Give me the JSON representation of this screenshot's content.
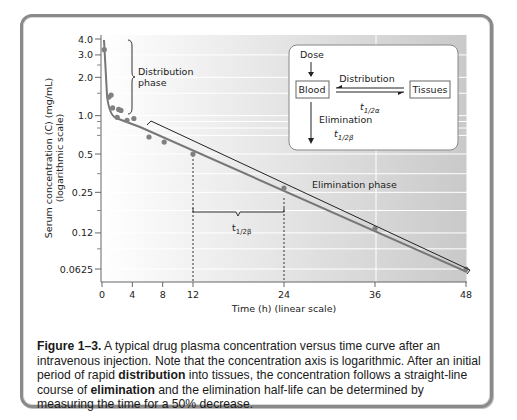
{
  "figure": {
    "caption_label": "Figure 1–3.",
    "caption_parts": [
      {
        "text": " A typical drug plasma concentration versus time curve after an intravenous injection. Note that the concentration axis is logarithmic. After an initial period of rapid ",
        "bold": false
      },
      {
        "text": "distribution",
        "bold": true
      },
      {
        "text": " into tissues, the concentration follows a straight-line course of ",
        "bold": false
      },
      {
        "text": "elimination",
        "bold": true
      },
      {
        "text": " and the elimination half-life can be determined by measuring the time for a 50% decrease.",
        "bold": false
      }
    ]
  },
  "annotations": {
    "distribution_phase_line1": "Distribution",
    "distribution_phase_line2": "phase",
    "elimination_phase": "Elimination phase",
    "half_life_main": "t",
    "half_life_sub": "1/2β"
  },
  "inset": {
    "dose": "Dose",
    "blood": "Blood",
    "tissues": "Tissues",
    "distribution": "Distribution",
    "dist_half_life_main": "t",
    "dist_half_life_sub": "1/2α",
    "elimination": "Elimination",
    "elim_half_life_main": "t",
    "elim_half_life_sub": "1/2β"
  },
  "chart_data": {
    "type": "line",
    "title": "",
    "xlabel": "Time (h) (linear scale)",
    "ylabel": "Serum concentration (C) (mg/mL) (logarithmic scale)",
    "x_ticks": [
      0,
      4,
      8,
      12,
      24,
      36,
      48
    ],
    "y_ticks": [
      "4.0",
      "3.0",
      "2.0",
      "1.0",
      "0.5",
      "0.25",
      "0.12",
      "0.0625"
    ],
    "y_scale": "log",
    "xlim": [
      0,
      48
    ],
    "ylim": [
      0.0625,
      4.0
    ],
    "grid": true,
    "series": [
      {
        "name": "Measured concentration",
        "points": [
          {
            "x": 0.3,
            "y": 3.3
          },
          {
            "x": 0.9,
            "y": 1.4
          },
          {
            "x": 1.2,
            "y": 1.45
          },
          {
            "x": 1.4,
            "y": 1.15
          },
          {
            "x": 2.2,
            "y": 1.12
          },
          {
            "x": 2.5,
            "y": 1.1
          },
          {
            "x": 2.0,
            "y": 0.97
          },
          {
            "x": 3.3,
            "y": 0.92
          },
          {
            "x": 4.2,
            "y": 0.95
          },
          {
            "x": 6.2,
            "y": 0.68
          },
          {
            "x": 8.2,
            "y": 0.62
          },
          {
            "x": 12,
            "y": 0.5
          },
          {
            "x": 24,
            "y": 0.27
          },
          {
            "x": 36,
            "y": 0.13
          },
          {
            "x": 48,
            "y": 0.0625
          }
        ]
      }
    ],
    "annotations": [
      {
        "text": "Distribution phase",
        "range_x": [
          0,
          4
        ]
      },
      {
        "text": "Elimination phase",
        "range_x": [
          6,
          48
        ]
      },
      {
        "text": "t1/2β",
        "from_x": 12,
        "to_x": 24
      }
    ]
  }
}
